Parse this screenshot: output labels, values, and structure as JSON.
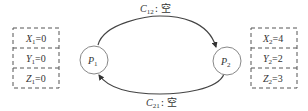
{
  "processes": [
    {
      "id": "p1",
      "label": "P",
      "subscript": "1"
    },
    {
      "id": "p2",
      "label": "P",
      "subscript": "2"
    }
  ],
  "channels": [
    {
      "id": "c12",
      "label": "C",
      "subscript": "12",
      "separator": ":",
      "content": "空",
      "from": "p1",
      "to": "p2"
    },
    {
      "id": "c21",
      "label": "C",
      "subscript": "21",
      "separator": ":",
      "content": "空",
      "from": "p2",
      "to": "p1"
    }
  ],
  "state_boxes": [
    {
      "process": "p1",
      "vars": [
        {
          "name": "X",
          "subscript": "1",
          "eq": "=",
          "value": "0"
        },
        {
          "name": "Y",
          "subscript": "1",
          "eq": "=",
          "value": "0"
        },
        {
          "name": "Z",
          "subscript": "1",
          "eq": "=",
          "value": "0"
        }
      ]
    },
    {
      "process": "p2",
      "vars": [
        {
          "name": "X",
          "subscript": "2",
          "eq": "=",
          "value": "4"
        },
        {
          "name": "Y",
          "subscript": "2",
          "eq": "=",
          "value": "2"
        },
        {
          "name": "Z",
          "subscript": "2",
          "eq": "=",
          "value": "3"
        }
      ]
    }
  ],
  "colors": {
    "stroke": "#444444",
    "node_stroke": "#888888",
    "text": "#333333"
  }
}
